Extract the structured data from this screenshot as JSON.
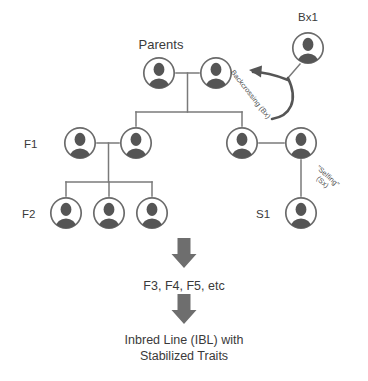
{
  "diagram": {
    "title_visible": false,
    "colors": {
      "icon_fill": "#555555",
      "icon_stroke": "#6b6b6b",
      "line": "#7a7a7a",
      "arrow_block": "#6e6e6e",
      "text": "#3a3a3a"
    },
    "generation_labels": {
      "parents": "Parents",
      "f1": "F1",
      "f2": "F2",
      "s1": "S1",
      "bx1": "Bx1"
    },
    "annotations": {
      "backcrossing": "Backcrossing (Bx)",
      "selfing_line1": "\"Selfing\"",
      "selfing_line2": "(Sx)"
    },
    "stages": {
      "later_generations": "F3, F4, F5, etc",
      "outcome_line1": "Inbred Line (IBL) with",
      "outcome_line2": "Stabilized Traits"
    },
    "nodes": [
      {
        "id": "parent-left",
        "group": "parents",
        "cx": 159,
        "cy": 73,
        "r": 17
      },
      {
        "id": "parent-right",
        "group": "parents",
        "cx": 216,
        "cy": 73,
        "r": 17
      },
      {
        "id": "f1-a",
        "group": "f1",
        "cx": 80,
        "cy": 143,
        "r": 17
      },
      {
        "id": "f1-b",
        "group": "f1",
        "cx": 136,
        "cy": 143,
        "r": 17
      },
      {
        "id": "f1-c",
        "group": "f1",
        "cx": 242,
        "cy": 143,
        "r": 17
      },
      {
        "id": "f1-d",
        "group": "f1",
        "cx": 301,
        "cy": 143,
        "r": 17
      },
      {
        "id": "f2-a",
        "group": "f2",
        "cx": 66,
        "cy": 213,
        "r": 17
      },
      {
        "id": "f2-b",
        "group": "f2",
        "cx": 109,
        "cy": 213,
        "r": 17
      },
      {
        "id": "f2-c",
        "group": "f2",
        "cx": 152,
        "cy": 213,
        "r": 17
      },
      {
        "id": "s1",
        "group": "s1",
        "cx": 301,
        "cy": 213,
        "r": 17
      },
      {
        "id": "bx1",
        "group": "bx1",
        "cx": 308,
        "cy": 48,
        "r": 17
      }
    ],
    "icon_name": "person-icon"
  }
}
